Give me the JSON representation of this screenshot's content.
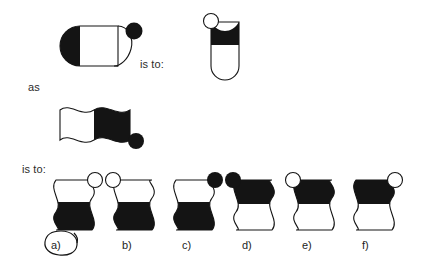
{
  "page": {
    "background": "#ffffff",
    "ink": "#141414"
  },
  "connectors": {
    "as_label": "as",
    "is_to_label_top": "is to:",
    "is_to_label_bottom": "is to:"
  },
  "prompt": {
    "source_a": {
      "name": "horizontal-capsule-black-left-with-filled-ball",
      "orientation": "horizontal",
      "fill_half": "left",
      "fill_color": "#141414",
      "ball": {
        "position": "right",
        "style": "filled",
        "color": "#141414"
      }
    },
    "target_a": {
      "name": "vertical-capsule-black-top-with-outline-ball",
      "orientation": "vertical",
      "fill_half": "top",
      "fill_color": "#141414",
      "ball": {
        "position": "top-left",
        "style": "outline",
        "color": "#ffffff"
      }
    },
    "source_b": {
      "name": "horizontal-wavy-bar-black-right-with-filled-ball",
      "orientation": "horizontal",
      "fill_half": "right",
      "fill_color": "#141414",
      "ball": {
        "position": "bottom-right",
        "style": "filled",
        "color": "#141414"
      }
    }
  },
  "options": [
    {
      "id": "a",
      "label": "a)",
      "fill_half": "bottom",
      "ball_side": "right",
      "ball_style": "outline",
      "circled": true
    },
    {
      "id": "b",
      "label": "b)",
      "fill_half": "bottom",
      "ball_side": "left",
      "ball_style": "outline",
      "circled": false
    },
    {
      "id": "c",
      "label": "c)",
      "fill_half": "bottom",
      "ball_side": "right",
      "ball_style": "filled",
      "circled": false
    },
    {
      "id": "d",
      "label": "d)",
      "fill_half": "top",
      "ball_side": "left",
      "ball_style": "filled",
      "circled": false
    },
    {
      "id": "e",
      "label": "e)",
      "fill_half": "top",
      "ball_side": "left",
      "ball_style": "outline",
      "circled": false
    },
    {
      "id": "f",
      "label": "f)",
      "fill_half": "top",
      "ball_side": "right",
      "ball_style": "outline",
      "circled": false
    }
  ],
  "selection": {
    "marked_option": "a",
    "mark_style": "hand-drawn-ellipse"
  }
}
